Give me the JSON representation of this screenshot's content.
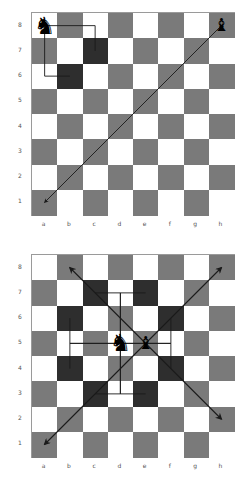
{
  "colors": {
    "light": "#ffffff",
    "dark": "#7a7a7a",
    "highlight": "#2e2e2e",
    "line": "#1a1a1a",
    "border": "#9a9a9a",
    "label": "#555555"
  },
  "files": [
    "a",
    "b",
    "c",
    "d",
    "e",
    "f",
    "g",
    "h"
  ],
  "ranks": [
    "8",
    "7",
    "6",
    "5",
    "4",
    "3",
    "2",
    "1"
  ],
  "diagrams": [
    {
      "name": "top-diagram",
      "board": {
        "left": 31,
        "top": 12,
        "size": 202
      },
      "pieces": [
        {
          "type": "knight",
          "color": "black",
          "square": "a8",
          "glyph": "♞"
        },
        {
          "type": "bishop",
          "color": "black",
          "square": "h8",
          "glyph": "♝"
        }
      ],
      "highlights": [
        "c7",
        "b6"
      ],
      "knight_paths": [
        [
          "a8",
          "c8",
          "c7"
        ],
        [
          "a8",
          "a6",
          "b6"
        ]
      ],
      "arrows": [
        {
          "from": "h8",
          "to": "a1"
        }
      ]
    },
    {
      "name": "bottom-diagram",
      "board": {
        "left": 31,
        "top": 254,
        "size": 202
      },
      "pieces": [
        {
          "type": "knight",
          "color": "black",
          "square": "d5",
          "glyph": "♞"
        },
        {
          "type": "bishop",
          "color": "black",
          "square": "e5",
          "glyph": "♝"
        }
      ],
      "highlights": [
        "c7",
        "e7",
        "b6",
        "f6",
        "b4",
        "f4",
        "c3",
        "e3"
      ],
      "knight_paths": [
        [
          "d5",
          "d7",
          "c7"
        ],
        [
          "d5",
          "d7",
          "e7"
        ],
        [
          "d5",
          "b5",
          "b6"
        ],
        [
          "d5",
          "f5",
          "f6"
        ],
        [
          "d5",
          "b5",
          "b4"
        ],
        [
          "d5",
          "f5",
          "f4"
        ],
        [
          "d5",
          "d3",
          "c3"
        ],
        [
          "d5",
          "d3",
          "e3"
        ]
      ],
      "arrows": [
        {
          "from": "e5",
          "to": "b8"
        },
        {
          "from": "e5",
          "to": "h8"
        },
        {
          "from": "e5",
          "to": "a1"
        },
        {
          "from": "e5",
          "to": "h2"
        }
      ]
    }
  ]
}
